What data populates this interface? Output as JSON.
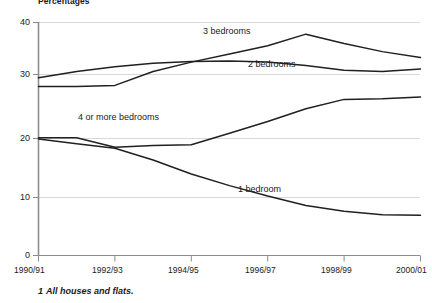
{
  "chart_data": {
    "type": "line",
    "title": "",
    "ylabel": "Percentages",
    "xlabel": "",
    "ylim": [
      0,
      40
    ],
    "yticks": [
      0,
      10,
      20,
      30,
      40
    ],
    "ytick_labels": [
      "0",
      "10",
      "20",
      "30",
      "40"
    ],
    "x": [
      "1990/91",
      "1991/92",
      "1992/93",
      "1993/94",
      "1994/95",
      "1995/96",
      "1996/97",
      "1997/98",
      "1998/99",
      "1999/00",
      "2000/01"
    ],
    "xticks": [
      "1990/91",
      "1992/93",
      "1994/95",
      "1996/97",
      "1998/99",
      "2000/01"
    ],
    "grid": true,
    "legend_position": "inline-annotations",
    "series": [
      {
        "name": "3 bedrooms",
        "label": "3 bedrooms",
        "color": "#231f20",
        "values": [
          29.0,
          29.0,
          29.2,
          31.6,
          33.2,
          34.6,
          36.0,
          38.0,
          36.4,
          35.0,
          34.0
        ]
      },
      {
        "name": "2 bedrooms",
        "label": "2 bedrooms",
        "color": "#231f20",
        "values": [
          30.5,
          31.6,
          32.4,
          33.0,
          33.3,
          33.4,
          33.2,
          32.6,
          31.8,
          31.6,
          32.0
        ]
      },
      {
        "name": "4 or more bedrooms",
        "label": "4 or more bedrooms",
        "color": "#231f20",
        "values": [
          20.2,
          20.2,
          18.6,
          18.9,
          19.0,
          21.0,
          23.0,
          25.2,
          26.8,
          26.9,
          27.2
        ]
      },
      {
        "name": "1 bedroom",
        "label": "1 bedroom",
        "color": "#231f20",
        "values": [
          20.0,
          19.2,
          18.4,
          16.4,
          14.0,
          12.0,
          10.2,
          8.6,
          7.6,
          7.0,
          6.9
        ]
      }
    ],
    "annotations": {
      "footnote_number": "1",
      "footnote_text": "All houses and flats."
    }
  }
}
